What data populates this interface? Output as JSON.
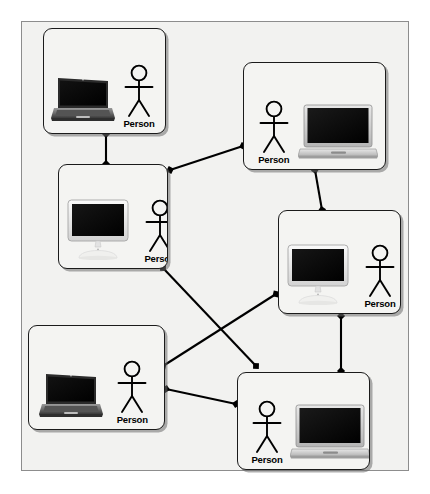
{
  "diagram": {
    "type": "network-topology",
    "background_color": "#f2f2f0",
    "border_color": "#8d8d8d",
    "node_fill": "#f4f4f2",
    "node_stroke": "#1b1b1b",
    "edge_color": "#000000",
    "label_color": "#000000"
  },
  "nodes": [
    {
      "id": "node-1",
      "actor_label": "Person",
      "device": "laptop-dark",
      "device_name": "dark-laptop-icon",
      "layout": "device-left",
      "x": 43,
      "y": 28,
      "w": 123,
      "h": 106
    },
    {
      "id": "node-2",
      "actor_label": "Person",
      "device": "laptop-silver",
      "device_name": "silver-laptop-icon",
      "layout": "device-right",
      "x": 243,
      "y": 62,
      "w": 143,
      "h": 108
    },
    {
      "id": "node-3",
      "actor_label": "Person",
      "device": "desktop",
      "device_name": "desktop-computer-icon",
      "layout": "device-left",
      "x": 58,
      "y": 164,
      "w": 110,
      "h": 105
    },
    {
      "id": "node-4",
      "actor_label": "Person",
      "device": "desktop",
      "device_name": "desktop-computer-icon",
      "layout": "device-left",
      "x": 278,
      "y": 210,
      "w": 123,
      "h": 104
    },
    {
      "id": "node-5",
      "actor_label": "Person",
      "device": "laptop-dark",
      "device_name": "dark-laptop-icon",
      "layout": "device-left",
      "x": 28,
      "y": 325,
      "w": 137,
      "h": 105
    },
    {
      "id": "node-6",
      "actor_label": "Person",
      "device": "laptop-silver",
      "device_name": "silver-laptop-icon",
      "layout": "device-right",
      "x": 237,
      "y": 372,
      "w": 133,
      "h": 98
    }
  ],
  "edges": [
    {
      "id": "edge-1-3",
      "from": "node-1",
      "to": "node-3",
      "x1": 106,
      "y1": 134,
      "x2": 106,
      "y2": 164
    },
    {
      "id": "edge-3-2",
      "from": "node-3",
      "to": "node-2",
      "x1": 170,
      "y1": 170,
      "x2": 243,
      "y2": 146
    },
    {
      "id": "edge-2-4",
      "from": "node-2",
      "to": "node-4",
      "x1": 315,
      "y1": 170,
      "x2": 322,
      "y2": 210
    },
    {
      "id": "edge-3-6",
      "from": "node-3",
      "to": "node-6",
      "x1": 163,
      "y1": 268,
      "x2": 256,
      "y2": 366
    },
    {
      "id": "edge-5-4",
      "from": "node-5",
      "to": "node-4",
      "x1": 163,
      "y1": 366,
      "x2": 276,
      "y2": 294
    },
    {
      "id": "edge-4-6",
      "from": "node-4",
      "to": "node-6",
      "x1": 341,
      "y1": 316,
      "x2": 341,
      "y2": 371
    },
    {
      "id": "edge-5-6",
      "from": "node-5",
      "to": "node-6",
      "x1": 166,
      "y1": 389,
      "x2": 236,
      "y2": 404
    }
  ]
}
